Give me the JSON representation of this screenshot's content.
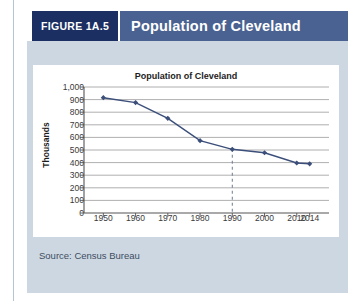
{
  "figure": {
    "tag": "FIGURE 1A.5",
    "title": "Population of Cleveland",
    "source": "Source: Census Bureau",
    "colors": {
      "tag_bg": "#1b2f63",
      "title_bg": "#4a6291",
      "panel_bg": "#ccd7e2",
      "card_bg": "#ffffff",
      "series": "#3c4f7a",
      "gridline": "#9a9a9a"
    }
  },
  "chart_data": {
    "type": "line",
    "title": "Population of Cleveland",
    "xlabel": "",
    "ylabel": "Thousands",
    "x": [
      1950,
      1960,
      1970,
      1980,
      1990,
      2000,
      2010,
      2014
    ],
    "values": [
      915,
      876,
      751,
      574,
      505,
      478,
      397,
      390
    ],
    "xticklabels": [
      "1950",
      "1960",
      "1970",
      "1980",
      "1990",
      "2000",
      "2010",
      "2014"
    ],
    "yticklabels": [
      "1,000",
      "900",
      "800",
      "700",
      "600",
      "500",
      "400",
      "300",
      "200",
      "100",
      "0"
    ],
    "ytickvalues": [
      1000,
      900,
      800,
      700,
      600,
      500,
      400,
      300,
      200,
      100,
      0
    ],
    "ylim": [
      0,
      1000
    ],
    "xlim": [
      1944,
      2020
    ],
    "grid": "horizontal",
    "legend": "none",
    "marker": "diamond",
    "annotations": [
      {
        "type": "vertical-dashed-line",
        "x": 1990
      }
    ]
  }
}
